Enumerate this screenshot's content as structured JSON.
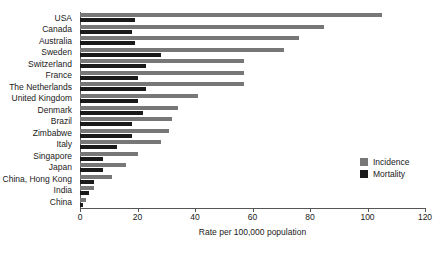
{
  "chart_data": {
    "type": "bar",
    "orientation": "horizontal",
    "title": "",
    "xlabel": "Rate per 100,000 population",
    "ylabel": "",
    "xlim": [
      0,
      120
    ],
    "xticks": [
      0,
      20,
      40,
      60,
      80,
      100,
      120
    ],
    "grid": false,
    "legend_position": "right-middle",
    "categories": [
      "USA",
      "Canada",
      "Australia",
      "Sweden",
      "Switzerland",
      "France",
      "The Netherlands",
      "United Kingdom",
      "Denmark",
      "Brazil",
      "Zimbabwe",
      "Italy",
      "Singapore",
      "Japan",
      "China, Hong Kong",
      "India",
      "China"
    ],
    "series": [
      {
        "name": "Incidence",
        "color": "#777777",
        "values": [
          105,
          85,
          76,
          71,
          57,
          57,
          57,
          41,
          34,
          32,
          31,
          28,
          20,
          16,
          11,
          5,
          2
        ]
      },
      {
        "name": "Mortality",
        "color": "#1a1a1a",
        "values": [
          19,
          18,
          19,
          28,
          23,
          20,
          23,
          20,
          22,
          18,
          18,
          13,
          8,
          8,
          5,
          3,
          1
        ]
      }
    ]
  },
  "legend": {
    "items": [
      {
        "label": "Incidence",
        "swatch": "incidence"
      },
      {
        "label": "Mortality",
        "swatch": "mortality"
      }
    ]
  }
}
